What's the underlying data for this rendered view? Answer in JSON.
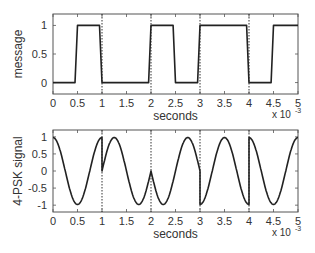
{
  "chart_data": [
    {
      "type": "line",
      "title": "",
      "xlabel": "seconds",
      "ylabel": "message",
      "x_multiplier_label": "x 10",
      "x_multiplier_exp": "-3",
      "xlim": [
        0,
        5
      ],
      "ylim": [
        -0.2,
        1.2
      ],
      "xticks": [
        "0",
        "0.5",
        "1",
        "1.5",
        "2",
        "2.5",
        "3",
        "3.5",
        "4",
        "4.5",
        "5"
      ],
      "yticks": [
        "0",
        "0.5",
        "1"
      ],
      "ytick_values": [
        0,
        0.5,
        1
      ],
      "grid": false,
      "symbol_boundaries": [
        1,
        2,
        3,
        4
      ],
      "series": [
        {
          "name": "message",
          "x": [
            0,
            0.45,
            0.5,
            0.95,
            1.0,
            1.95,
            2.0,
            2.45,
            2.5,
            2.95,
            3.0,
            3.95,
            4.0,
            4.45,
            4.5,
            5.0
          ],
          "y": [
            0,
            0,
            1,
            1,
            0,
            0,
            1,
            1,
            0,
            0,
            1,
            1,
            0,
            0,
            1,
            1
          ]
        }
      ],
      "bits": [
        "01",
        "00",
        "10",
        "11",
        "01"
      ]
    },
    {
      "type": "line",
      "title": "",
      "xlabel": "seconds",
      "ylabel": "4-PSK signal",
      "x_multiplier_label": "x 10",
      "x_multiplier_exp": "-3",
      "xlim": [
        0,
        5
      ],
      "ylim": [
        -1.2,
        1.2
      ],
      "xticks": [
        "0",
        "0.5",
        "1",
        "1.5",
        "2",
        "2.5",
        "3",
        "3.5",
        "4",
        "4.5",
        "5"
      ],
      "yticks": [
        "-1",
        "-0.5",
        "0",
        "0.5",
        "1"
      ],
      "ytick_values": [
        -1,
        -0.5,
        0,
        0.5,
        1
      ],
      "grid": false,
      "symbol_boundaries": [
        1,
        2,
        3,
        4
      ],
      "carrier_frequency_khz": 1,
      "series": [
        {
          "name": "4-PSK signal",
          "segments": [
            {
              "from": 0,
              "to": 1,
              "waveform": "cos"
            },
            {
              "from": 1,
              "to": 2,
              "waveform": "sin"
            },
            {
              "from": 2,
              "to": 3,
              "waveform": "-sin"
            },
            {
              "from": 3,
              "to": 4,
              "waveform": "-cos"
            },
            {
              "from": 4,
              "to": 5,
              "waveform": "cos"
            }
          ]
        }
      ]
    }
  ]
}
